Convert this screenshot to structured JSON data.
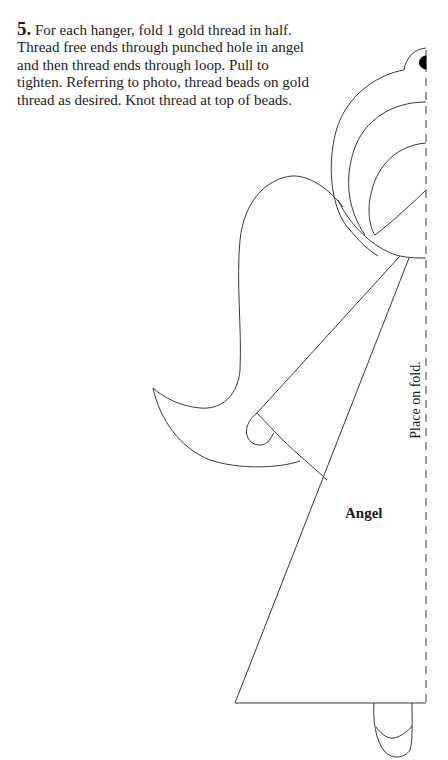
{
  "instructions": {
    "step_number": "5.",
    "text": " For each hanger, fold 1 gold thread in half. Thread free ends through punched hole in angel and then thread ends through loop. Pull to tighten. Referring to photo, thread beads on gold thread as desired. Knot thread at top of beads."
  },
  "pattern": {
    "piece_label": "Angel",
    "fold_label": "Place on fold.",
    "line_color": "#3a3a3a",
    "hole_color": "#000000"
  }
}
